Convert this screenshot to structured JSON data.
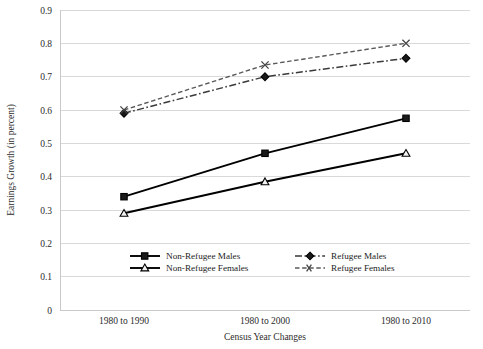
{
  "chart_data": {
    "type": "line",
    "title": "",
    "xlabel": "Census Year Changes",
    "ylabel": "Earnings Growth (in percent)",
    "categories": [
      "1980 to 1990",
      "1980 to 2000",
      "1980 to 2010"
    ],
    "ylim": [
      0,
      0.9
    ],
    "yticks": [
      "0",
      "0.1",
      "0.2",
      "0.3",
      "0.4",
      "0.5",
      "0.6",
      "0.7",
      "0.8",
      "0.9"
    ],
    "ytick_values": [
      0,
      0.1,
      0.2,
      0.3,
      0.4,
      0.5,
      0.6,
      0.7,
      0.8,
      0.9
    ],
    "grid": true,
    "legend_position": "inside-bottom",
    "series": [
      {
        "name": "Non-Refugee Males",
        "values": [
          0.34,
          0.47,
          0.575
        ],
        "style": "solid",
        "marker": "square-dark",
        "color": "#000000"
      },
      {
        "name": "Non-Refugee Females",
        "values": [
          0.29,
          0.385,
          0.47
        ],
        "style": "solid",
        "marker": "triangle-open",
        "color": "#000000"
      },
      {
        "name": "Refugee  Males",
        "values": [
          0.59,
          0.7,
          0.755
        ],
        "style": "dash-dot",
        "marker": "diamond-dark",
        "color": "#3a3a3a"
      },
      {
        "name": "Refugee Females",
        "values": [
          0.6,
          0.735,
          0.8
        ],
        "style": "dashed",
        "marker": "x-cross",
        "color": "#5a5a5a"
      }
    ]
  },
  "axis": {
    "y_title": "Earnings Growth (in percent)",
    "x_title": "Census Year Changes",
    "y_labels": [
      "0.9",
      "0.8",
      "0.7",
      "0.6",
      "0.5",
      "0.4",
      "0.3",
      "0.2",
      "0.1",
      "0"
    ],
    "x_labels": [
      "1980 to 1990",
      "1980 to 2000",
      "1980 to 2010"
    ]
  },
  "legend": {
    "items": [
      {
        "label": "Non-Refugee Males"
      },
      {
        "label": "Non-Refugee Females"
      },
      {
        "label": "Refugee  Males"
      },
      {
        "label": "Refugee Females"
      }
    ]
  }
}
